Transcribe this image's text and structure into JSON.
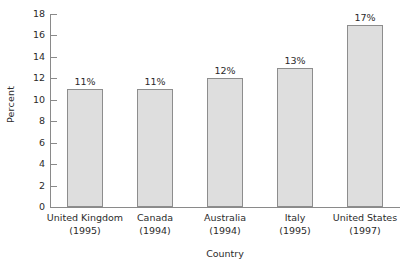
{
  "chart_data": {
    "type": "bar",
    "title": "",
    "subtitle": "",
    "xlabel": "Country",
    "ylabel": "Percent",
    "categories": [
      "United Kingdom",
      "Canada",
      "Australia",
      "Italy",
      "United States"
    ],
    "category_sublabels": [
      "(1995)",
      "(1994)",
      "(1994)",
      "(1995)",
      "(1997)"
    ],
    "values": [
      11,
      11,
      12,
      13,
      17
    ],
    "data_labels": [
      "11%",
      "11%",
      "12%",
      "13%",
      "17%"
    ],
    "ylim": [
      0,
      18
    ],
    "ytick_values": [
      0,
      2,
      4,
      6,
      8,
      10,
      12,
      14,
      16,
      18
    ],
    "ytick_labels": [
      "0",
      "2",
      "4",
      "6",
      "8",
      "10",
      "12",
      "14",
      "16",
      "18"
    ],
    "grid": false,
    "legend": null,
    "bar_fill_color": "#dedede",
    "bar_border_color": "#8d8d8d",
    "axis_color": "#8a8a8a",
    "text_color": "#2b2b2b",
    "background_color": "#ffffff"
  }
}
